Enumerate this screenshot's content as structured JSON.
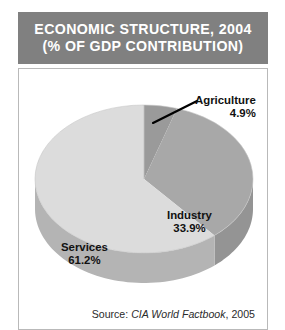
{
  "header": {
    "title_line1": "ECONOMIC STRUCTURE, 2004",
    "title_line2": "(% OF GDP CONTRIBUTION)",
    "background_color": "#808080",
    "text_color": "#ffffff"
  },
  "source": {
    "prefix": "Source: ",
    "publication": "CIA World Factbook",
    "suffix": ", 2005",
    "full_text": "Source: CIA World Factbook, 2005"
  },
  "labels": {
    "agriculture": {
      "name": "Agriculture",
      "value_text": "4.9%"
    },
    "industry": {
      "name": "Industry",
      "value_text": "33.9%"
    },
    "services": {
      "name": "Services",
      "value_text": "61.2%"
    }
  },
  "chart_data": {
    "type": "pie",
    "title": "ECONOMIC STRUCTURE, 2004 (% OF GDP CONTRIBUTION)",
    "subtitle": "(% OF GDP CONTRIBUTION)",
    "xlabel": "",
    "ylabel": "",
    "unit": "% of GDP",
    "three_d": true,
    "start_angle_deg": 0,
    "direction": "clockwise",
    "categories": [
      "Agriculture",
      "Industry",
      "Services"
    ],
    "values": [
      4.9,
      33.9,
      61.2
    ],
    "labels_text": [
      "Agriculture 4.9%",
      "Industry 33.9%",
      "Services 61.2%"
    ],
    "colors": [
      "#9a9a9a",
      "#a8a8a8",
      "#dcdcdc"
    ],
    "side_colors": [
      "#8c8c8c",
      "#949494",
      "#b4b4b4"
    ],
    "legend": "none",
    "legend_position": "inline-labels",
    "grid": false,
    "annotations": [
      {
        "text": "Agriculture 4.9%",
        "leader_line": true,
        "target_slice": "Agriculture"
      }
    ],
    "source": "Source: CIA World Factbook, 2005"
  }
}
